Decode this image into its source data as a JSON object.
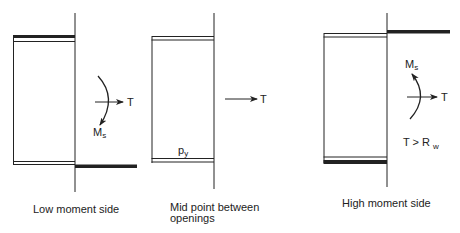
{
  "colors": {
    "line": "#222222",
    "background": "#ffffff"
  },
  "panels": [
    {
      "caption_lines": [
        "Low moment side"
      ],
      "tension_label": "T",
      "moment_label": "M",
      "moment_subscript": "s"
    },
    {
      "caption_lines": [
        "Mid point between",
        "openings"
      ],
      "tension_label": "T",
      "stress_label": "p",
      "stress_subscript": "y"
    },
    {
      "caption_lines": [
        "High moment side"
      ],
      "tension_label": "T",
      "moment_label": "M",
      "moment_subscript": "s",
      "condition_text": "T > R",
      "condition_subscript": "w"
    }
  ]
}
